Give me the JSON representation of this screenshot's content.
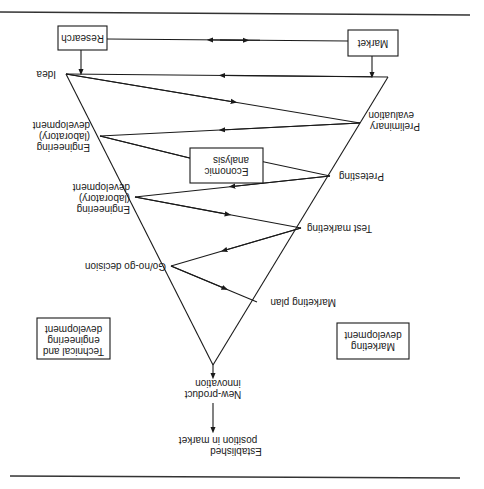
{
  "diagram": {
    "orientation": "rotated 180 degrees (upside-down)",
    "boxes": {
      "research": "Research",
      "market": "Market",
      "economic_analysis": [
        "Economic",
        "analysis"
      ],
      "technical_dev": [
        "Technical and",
        "engineering",
        "development"
      ],
      "marketing_dev": [
        "Marketing",
        "development"
      ]
    },
    "nodes": {
      "idea": [
        "Idea"
      ],
      "preliminary_evaluation": [
        "Preliminary",
        "evaluation"
      ],
      "engineering_1": [
        "Engineering",
        "(laboratory)",
        "development"
      ],
      "pretesting": [
        "Pretesting"
      ],
      "engineering_2": [
        "Engineering",
        "(laboratory)",
        "development"
      ],
      "test_marketing": [
        "Test marketing"
      ],
      "go_no_go": [
        "Go/no-go decision"
      ],
      "marketing_plan": [
        "Marketing plan"
      ],
      "new_product": [
        "New-product",
        "innovation"
      ],
      "established": [
        "Established",
        "position in market"
      ]
    },
    "flow_sequence": [
      "Idea",
      "Preliminary evaluation",
      "Engineering (laboratory) development",
      "Pretesting",
      "Engineering (laboratory) development",
      "Test marketing",
      "Go/no-go decision",
      "Marketing plan",
      "New-product innovation",
      "Established position in market"
    ],
    "connections": [
      {
        "from": "Research",
        "to": "Market",
        "type": "bidirectional"
      },
      {
        "from": "Research",
        "to": "Idea"
      },
      {
        "from": "Market",
        "to": "Idea"
      },
      {
        "from": "Idea",
        "to": "Preliminary evaluation"
      },
      {
        "from": "Preliminary evaluation",
        "to": "Engineering (laboratory) development"
      },
      {
        "from": "Engineering (laboratory) development",
        "to": "Economic analysis"
      },
      {
        "from": "Economic analysis",
        "to": "Pretesting"
      },
      {
        "from": "Pretesting",
        "to": "Engineering (laboratory) development"
      },
      {
        "from": "Engineering (laboratory) development",
        "to": "Test marketing"
      },
      {
        "from": "Test marketing",
        "to": "Go/no-go decision"
      },
      {
        "from": "Go/no-go decision",
        "to": "Marketing plan"
      },
      {
        "from": "Marketing plan",
        "to": "New-product innovation"
      },
      {
        "from": "New-product innovation",
        "to": "Established position in market"
      }
    ]
  }
}
